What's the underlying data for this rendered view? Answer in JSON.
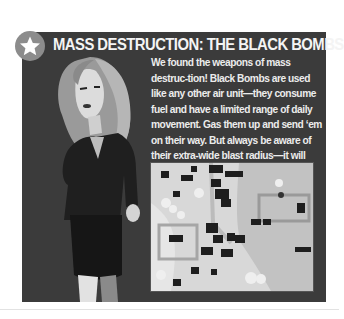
{
  "panel": {
    "badge_icon": "star-icon",
    "title": "MASS DESTRUCTION: THE BLACK BOMBS",
    "body_text": "We found the weapons of mass destruc-tion! Black Bombs are used like any other air unit—they consume fuel and have a limited range of daily movement. Gas them up and send ‘em on their way. But always be aware of their extra-wide blast radius—it will damage anything nearby, including your own units.",
    "illustration": "woman-in-dark-suit-character",
    "screenshot": "tactical-map-screenshot"
  },
  "colors": {
    "panel_bg": "#3b3b3b",
    "badge_bg": "#8c8c8c",
    "text": "#ececec",
    "page_bg": "#ffffff"
  }
}
